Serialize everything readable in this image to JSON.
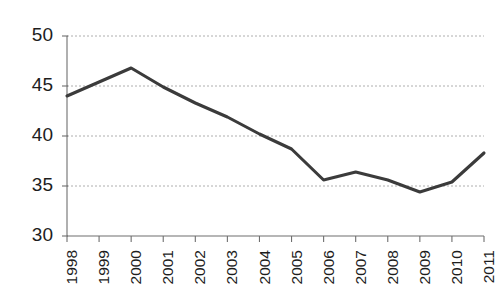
{
  "chart_data": {
    "type": "line",
    "title": "",
    "subtitle": "",
    "xlabel": "",
    "ylabel": "",
    "categories": [
      "1998",
      "1999",
      "2000",
      "2001",
      "2002",
      "2003",
      "2004",
      "2005",
      "2006",
      "2007",
      "2008",
      "2009",
      "2010",
      "2011"
    ],
    "values": [
      44.0,
      45.4,
      46.8,
      44.9,
      43.3,
      41.9,
      40.2,
      38.7,
      35.6,
      36.4,
      35.6,
      34.4,
      35.4,
      38.3
    ],
    "series": [
      {
        "name": "series-1",
        "color": "#3b3b3b",
        "values": [
          44.0,
          45.4,
          46.8,
          44.9,
          43.3,
          41.9,
          40.2,
          38.7,
          35.6,
          36.4,
          35.6,
          34.4,
          35.4,
          38.3
        ]
      }
    ],
    "ylim": [
      30,
      50
    ],
    "yticks": [
      30,
      35,
      40,
      45,
      50
    ],
    "ytick_labels": [
      "30",
      "35",
      "40",
      "45",
      "50"
    ],
    "xtick_labels": [
      "1998",
      "1999",
      "2000",
      "2001",
      "2002",
      "2003",
      "2004",
      "2005",
      "2006",
      "2007",
      "2008",
      "2009",
      "2010",
      "2011"
    ],
    "xtick_rotation": -90,
    "grid": {
      "horizontal": true,
      "vertical": false,
      "style": "dashed",
      "color": "#9a9a9a"
    },
    "legend": {
      "visible": false,
      "position": "none",
      "entries": []
    },
    "annotations": [],
    "axis": {
      "left_spine": true,
      "bottom_spine": true,
      "top_spine": false,
      "right_spine": false,
      "tick_direction": "out"
    },
    "plot_area": {
      "left": 67,
      "right": 484,
      "top": 36,
      "bottom": 236
    }
  }
}
